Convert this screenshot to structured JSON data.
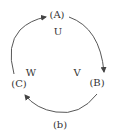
{
  "diagram": {
    "nodes": [
      {
        "id": "A",
        "label": "(A)",
        "x": 57,
        "y": 15
      },
      {
        "id": "B",
        "label": "(B)",
        "x": 97,
        "y": 83
      },
      {
        "id": "C",
        "label": "(C)",
        "x": 19,
        "y": 84
      }
    ],
    "edge_labels": [
      {
        "id": "U",
        "label": "U",
        "x": 58,
        "y": 32
      },
      {
        "id": "V",
        "label": "V",
        "x": 77,
        "y": 73
      },
      {
        "id": "W",
        "label": "W",
        "x": 31,
        "y": 73
      }
    ],
    "edges": [
      {
        "from": "A",
        "to": "B",
        "direction": "clockwise"
      },
      {
        "from": "B",
        "to": "C",
        "direction": "clockwise"
      },
      {
        "from": "C",
        "to": "A",
        "direction": "clockwise"
      }
    ],
    "caption": "(b)",
    "line_color": "#444444",
    "text_color": "#333333"
  }
}
